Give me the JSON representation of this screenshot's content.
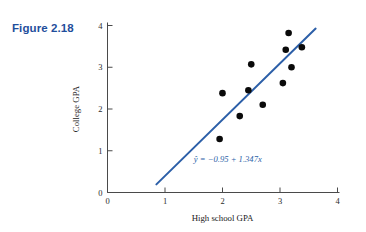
{
  "figure": {
    "label": "Figure 2.18",
    "label_color": "#1F4E9C"
  },
  "chart_data": {
    "type": "scatter",
    "title": "",
    "xlabel": "High school GPA",
    "ylabel": "College GPA",
    "xlim": [
      0,
      4
    ],
    "ylim": [
      0,
      4
    ],
    "xticks": [
      0,
      1,
      2,
      3,
      4
    ],
    "yticks": [
      0,
      1,
      2,
      3,
      4
    ],
    "xtick_labels": [
      "0",
      "1",
      "2",
      "3",
      "4"
    ],
    "ytick_labels": [
      "0",
      "1",
      "2",
      "3",
      "4"
    ],
    "grid": false,
    "legend": false,
    "point_color": "#0a0a0a",
    "line_color": "#2C5FA8",
    "points": [
      {
        "x": 1.95,
        "y": 1.28
      },
      {
        "x": 2.0,
        "y": 2.38
      },
      {
        "x": 2.3,
        "y": 1.83
      },
      {
        "x": 2.45,
        "y": 2.45
      },
      {
        "x": 2.5,
        "y": 3.07
      },
      {
        "x": 2.7,
        "y": 2.1
      },
      {
        "x": 3.05,
        "y": 2.62
      },
      {
        "x": 3.1,
        "y": 3.42
      },
      {
        "x": 3.15,
        "y": 3.82
      },
      {
        "x": 3.38,
        "y": 3.48
      },
      {
        "x": 3.2,
        "y": 3.0
      }
    ],
    "regression": {
      "intercept": -0.95,
      "slope": 1.347,
      "equation": "ŷ = −0.95 + 1.347x",
      "x_start": 0.85,
      "x_end": 3.62
    },
    "annotations": [
      {
        "text": "ŷ = −0.95 + 1.347x",
        "x": 1.5,
        "y": 0.72
      }
    ]
  }
}
